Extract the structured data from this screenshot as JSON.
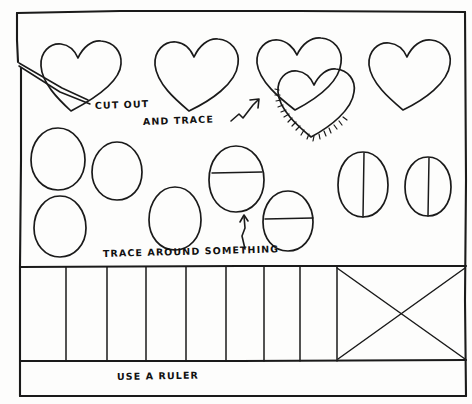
{
  "sheet": {
    "title": "Hand-drawn craft template worksheet",
    "background_color": "#fdfdfc",
    "ink_color": "#1a1a1a",
    "width": 472,
    "height": 404
  },
  "annotations": {
    "cut_out": "CUT OUT",
    "and_trace": "AND TRACE",
    "trace_around_something": "TRACE AROUND SOMETHING",
    "use_a_ruler": "USE A RULER"
  },
  "sections": {
    "hearts": {
      "label": "heart-row",
      "count": 5,
      "description": "Row of outlined hearts; the third position holds two overlapping hearts, the front one shaded along its lower-left edge"
    },
    "eggs": {
      "label": "egg-rows",
      "count": 8,
      "description": "Two staggered rows of egg/oval outlines; two eggs are divided by a horizontal line, two by a vertical line"
    },
    "ruler": {
      "label": "ruler-band",
      "cells": 8,
      "description": "Banded strip of equal vertical cells followed by a wide rectangle crossed by two diagonals"
    }
  },
  "marks": {
    "cut_line": "diagonal cut line from left edge toward first heart",
    "trace_arrow": "zigzag arrow pointing up-right",
    "point_arrow": "small arrow pointing up at an egg",
    "x_box": "rectangle with two crossing diagonals"
  }
}
